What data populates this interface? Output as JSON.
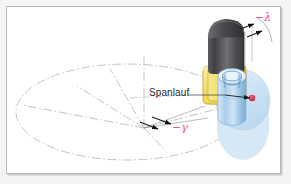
{
  "figure": {
    "kind": "technical-diagram",
    "background_color": "#f4f4f4",
    "canvas_color": "#ffffff",
    "frame_border_color": "#b9b9b9"
  },
  "labels": {
    "spanlauf": "Spanlauf",
    "lambda_angle": "−λ",
    "gamma_angle": "−γ"
  },
  "colors": {
    "annotation_red": "#e0558a",
    "label_text": "#2b2b2b",
    "construction_line": "#a9a9ad",
    "tool_gray_dark": "#3c3c3f",
    "tool_gray_light": "#9a9a9e",
    "insert_yellow": "#f2dd63",
    "insert_yellow_edge": "#b9a024",
    "workpiece_blue": "#9cc4e4",
    "workpiece_blue_light": "#cfe3f4",
    "marker_red": "#d02a4c",
    "arrow_black": "#1a1a1a"
  },
  "parts": {
    "base_plane": "dash-dot ellipse (reference plane)",
    "vertical_axis": "dash-dot vertical centre axis",
    "radial_lines": "dash-dot radial construction lines",
    "tool_shank": "grey cylindrical tool shank with domed top",
    "cutting_insert": "yellow rounded cutting insert",
    "workpiece": "blue cylindrical workpiece with helical groove",
    "workpiece_plane": "light blue elliptical reference disc",
    "contact_marker": "red contact point marker"
  }
}
